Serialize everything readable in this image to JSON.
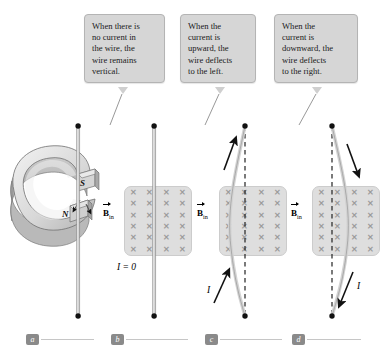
{
  "callouts": [
    {
      "id": "callout-b",
      "lines": [
        "When there is",
        "no current in",
        "the wire, the",
        "wire remains",
        "vertical."
      ]
    },
    {
      "id": "callout-c",
      "lines": [
        "When the",
        "current is",
        "upward, the",
        "wire deflects",
        "to the left."
      ]
    },
    {
      "id": "callout-d",
      "lines": [
        "When the",
        "current is",
        "downward, the",
        "wire deflects",
        "to the right."
      ]
    }
  ],
  "panels": [
    {
      "key": "a",
      "label": "a"
    },
    {
      "key": "b",
      "label": "b"
    },
    {
      "key": "c",
      "label": "c"
    },
    {
      "key": "d",
      "label": "d"
    }
  ],
  "magnet": {
    "north_label": "N",
    "south_label": "S"
  },
  "field_labels": {
    "b_symbol": "B",
    "b_subscript": "in",
    "cross_glyph": "✕",
    "grid_columns": 4,
    "grid_rows": 6
  },
  "current_labels": {
    "zero": "I = 0",
    "symbol": "I"
  },
  "colors": {
    "callout_bg": "#d6d6d6",
    "callout_border": "#b4b4b4",
    "field_bg": "#dedede",
    "cross_color": "#9b9b9b",
    "wire": "#d0d0d0",
    "wire_edge": "#8f8f8f",
    "badge_bg": "#8a8a8a",
    "rule": "#c6c6c6",
    "magnet_light": "#e8e8e8",
    "magnet_mid": "#c9c9c9",
    "magnet_dark": "#a6a6a6",
    "ink": "#111111"
  }
}
